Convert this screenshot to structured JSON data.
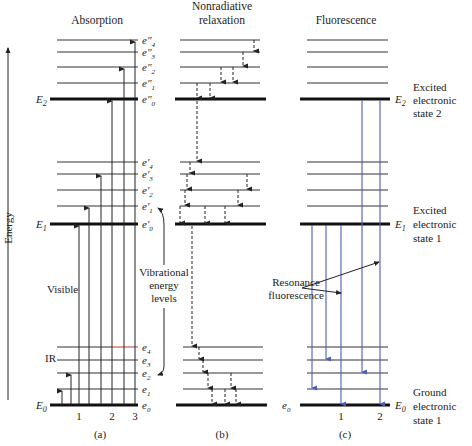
{
  "diagram": {
    "axis_label": "Energy",
    "panels": [
      {
        "id": "a",
        "title": "Absorption",
        "caption": "(a)",
        "transition_numbers": [
          "1",
          "2",
          "3"
        ]
      },
      {
        "id": "b",
        "title_line1": "Nonradiative",
        "title_line2": "relaxation",
        "caption": "(b)"
      },
      {
        "id": "c",
        "title": "Fluorescence",
        "caption": "(c)",
        "transition_numbers": [
          "1",
          "2"
        ]
      }
    ],
    "levels": {
      "E2": "E2",
      "E1": "E1",
      "E0": "E0",
      "upper_vib": [
        "e″0",
        "e″1",
        "e″2",
        "e″3",
        "e″4"
      ],
      "mid_vib": [
        "e′0",
        "e′1",
        "e′2",
        "e′3",
        "e′4"
      ],
      "ground_vib": [
        "e0",
        "e1",
        "e2",
        "e3",
        "e4"
      ],
      "fluor_e0": "e0"
    },
    "annotations": {
      "visible": "Visible",
      "ir": "IR",
      "vibrational_line1": "Vibrational",
      "vibrational_line2": "energy",
      "vibrational_line3": "levels",
      "resonance_line1": "Resonance",
      "resonance_line2": "fluorescence"
    },
    "states": {
      "excited2": [
        "Excited",
        "electronic",
        "state 2"
      ],
      "excited1": [
        "Excited",
        "electronic",
        "state 1"
      ],
      "ground": [
        "Ground",
        "electronic",
        "state 1"
      ]
    },
    "colors": {
      "fluorescence_arrow": "#4a5fb8",
      "e4_highlight": "#c0392b"
    }
  }
}
